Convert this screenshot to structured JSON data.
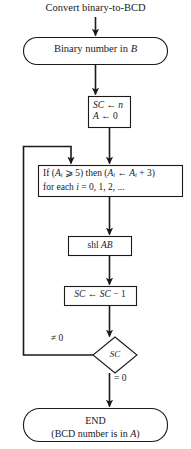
{
  "diagram": {
    "title": "Convert binary-to-BCD",
    "nodes": {
      "start": {
        "shape": "terminator",
        "text": "Binary number in B",
        "text_plain": "Binary number in B"
      },
      "init": {
        "shape": "process",
        "lines": [
          "SC ← n",
          "A ← 0"
        ]
      },
      "condition": {
        "shape": "process",
        "lines": [
          "If (Aᵢ ⩾ 5) then (Aᵢ ← Aᵢ + 3)",
          "for each i = 0, 1, 2, ..."
        ]
      },
      "shift": {
        "shape": "process",
        "text": "shl AB"
      },
      "decrement": {
        "shape": "process",
        "text": "SC ← SC − 1"
      },
      "decision": {
        "shape": "diamond",
        "text": "SC"
      },
      "end": {
        "shape": "terminator",
        "lines": [
          "END",
          "(BCD number is in A)"
        ]
      }
    },
    "edge_labels": {
      "loop_back": "≠ 0",
      "exit": "= 0"
    },
    "colors": {
      "stroke": "#1a1a1a",
      "background": "#ffffff",
      "text": "#1a1a1a"
    }
  }
}
